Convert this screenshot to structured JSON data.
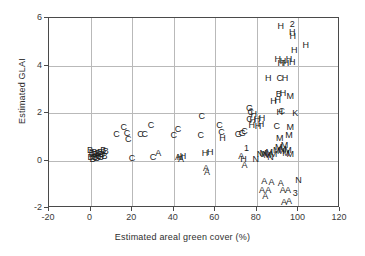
{
  "figure": {
    "background_color": "#ffffff",
    "frame_color": "#4a4a4a",
    "grid_color": "#b9b9b9",
    "marker_color": "#1c1c1c"
  },
  "chart_data": {
    "type": "scatter",
    "title": "",
    "xlabel": "Estimated areal green cover (%)",
    "ylabel": "Estimated GLAI",
    "xlim": [
      -20,
      120
    ],
    "ylim": [
      -2,
      6
    ],
    "xticks": [
      -20,
      0,
      20,
      40,
      60,
      80,
      100,
      120
    ],
    "yticks": [
      -2,
      0,
      2,
      4,
      6
    ],
    "xticklabels": [
      "-20",
      "0",
      "20",
      "40",
      "60",
      "80",
      "100",
      "120"
    ],
    "yticklabels": [
      "-2",
      "0",
      "2",
      "4",
      "6"
    ],
    "grid": true,
    "grid_axis": "both",
    "legend": "none",
    "marker_style": "text-letter",
    "marker_labels": [
      "A",
      "B",
      "C",
      "G",
      "H",
      "K",
      "M",
      "N",
      "1",
      "2",
      "3"
    ],
    "points": [
      {
        "label": "B",
        "x": 0.2,
        "y": 0.42
      },
      {
        "label": "B",
        "x": 0.4,
        "y": 0.12
      },
      {
        "label": "B",
        "x": 1.0,
        "y": 0.26
      },
      {
        "label": "B",
        "x": 1.4,
        "y": 0.02
      },
      {
        "label": "B",
        "x": 2.2,
        "y": 0.3
      },
      {
        "label": "B",
        "x": 2.6,
        "y": 0.1
      },
      {
        "label": "B",
        "x": 3.0,
        "y": 0.22
      },
      {
        "label": "B",
        "x": 3.5,
        "y": 0.05
      },
      {
        "label": "B",
        "x": 4.0,
        "y": 0.28
      },
      {
        "label": "B",
        "x": 4.4,
        "y": 0.14
      },
      {
        "label": "B",
        "x": 5.0,
        "y": 0.33
      },
      {
        "label": "B",
        "x": 5.4,
        "y": 0.09
      },
      {
        "label": "B",
        "x": 6.0,
        "y": 0.24
      },
      {
        "label": "B",
        "x": 6.6,
        "y": 0.4
      },
      {
        "label": "B",
        "x": 7.2,
        "y": 0.16
      },
      {
        "label": "B",
        "x": 7.8,
        "y": 0.35
      },
      {
        "label": "C",
        "x": 13.0,
        "y": 1.06
      },
      {
        "label": "C",
        "x": 16.5,
        "y": 1.38
      },
      {
        "label": "C",
        "x": 18.0,
        "y": 1.12
      },
      {
        "label": "C",
        "x": 18.6,
        "y": 0.86
      },
      {
        "label": "C",
        "x": 20.4,
        "y": 0.06
      },
      {
        "label": "C",
        "x": 24.5,
        "y": 1.06
      },
      {
        "label": "C",
        "x": 26.5,
        "y": 1.06
      },
      {
        "label": "C",
        "x": 29.5,
        "y": 1.46
      },
      {
        "label": "C",
        "x": 30.5,
        "y": 0.12
      },
      {
        "label": "A",
        "x": 33.0,
        "y": 0.26
      },
      {
        "label": "A",
        "x": 42.5,
        "y": 0.1
      },
      {
        "label": "H",
        "x": 43.5,
        "y": 0.12
      },
      {
        "label": "A",
        "x": 44.0,
        "y": 0.04
      },
      {
        "label": "H",
        "x": 45.0,
        "y": 0.14
      },
      {
        "label": "C",
        "x": 40.5,
        "y": 1.04
      },
      {
        "label": "C",
        "x": 42.5,
        "y": 1.3
      },
      {
        "label": "C",
        "x": 54.0,
        "y": 1.82
      },
      {
        "label": "C",
        "x": 53.5,
        "y": 1.02
      },
      {
        "label": "H",
        "x": 55.5,
        "y": 0.28
      },
      {
        "label": "H",
        "x": 58.0,
        "y": 0.3
      },
      {
        "label": "A",
        "x": 56.0,
        "y": -0.34
      },
      {
        "label": "A",
        "x": 56.5,
        "y": -0.54
      },
      {
        "label": "C",
        "x": 62.5,
        "y": 1.44
      },
      {
        "label": "C",
        "x": 63.5,
        "y": 1.14
      },
      {
        "label": "H",
        "x": 64.0,
        "y": 0.92
      },
      {
        "label": "G",
        "x": 71.5,
        "y": 1.06
      },
      {
        "label": "G",
        "x": 73.5,
        "y": 1.12
      },
      {
        "label": "C",
        "x": 74.5,
        "y": 1.2
      },
      {
        "label": "1",
        "x": 75.5,
        "y": 0.48
      },
      {
        "label": "H",
        "x": 74.0,
        "y": 0.02
      },
      {
        "label": "A",
        "x": 74.5,
        "y": -0.22
      },
      {
        "label": "A",
        "x": 73.0,
        "y": 0.14
      },
      {
        "label": "G",
        "x": 77.0,
        "y": 2.16
      },
      {
        "label": "C",
        "x": 77.5,
        "y": 1.98
      },
      {
        "label": "C",
        "x": 77.0,
        "y": 1.72
      },
      {
        "label": "H",
        "x": 78.5,
        "y": 1.68
      },
      {
        "label": "H",
        "x": 78.0,
        "y": 1.44
      },
      {
        "label": "H",
        "x": 79.0,
        "y": 1.92
      },
      {
        "label": "H",
        "x": 80.5,
        "y": 1.72
      },
      {
        "label": "H",
        "x": 81.0,
        "y": 1.42
      },
      {
        "label": "H",
        "x": 82.5,
        "y": 1.48
      },
      {
        "label": "H",
        "x": 83.0,
        "y": 1.76
      },
      {
        "label": "N",
        "x": 80.0,
        "y": 0.04
      },
      {
        "label": "N",
        "x": 82.0,
        "y": 0.22
      },
      {
        "label": "M",
        "x": 83.5,
        "y": 0.26
      },
      {
        "label": "N",
        "x": 84.5,
        "y": 0.22
      },
      {
        "label": "M",
        "x": 85.5,
        "y": 0.18
      },
      {
        "label": "M",
        "x": 86.5,
        "y": 0.3
      },
      {
        "label": "N",
        "x": 87.0,
        "y": 0.1
      },
      {
        "label": "M",
        "x": 88.5,
        "y": 0.24
      },
      {
        "label": "M",
        "x": 90.0,
        "y": 0.38
      },
      {
        "label": "M",
        "x": 91.0,
        "y": 0.52
      },
      {
        "label": "M",
        "x": 92.0,
        "y": 0.34
      },
      {
        "label": "M",
        "x": 93.0,
        "y": 0.46
      },
      {
        "label": "M",
        "x": 93.8,
        "y": 0.6
      },
      {
        "label": "M",
        "x": 94.5,
        "y": 0.28
      },
      {
        "label": "M",
        "x": 95.5,
        "y": 0.42
      },
      {
        "label": "M",
        "x": 96.5,
        "y": 0.22
      },
      {
        "label": "M",
        "x": 91.5,
        "y": 0.92
      },
      {
        "label": "M",
        "x": 96.0,
        "y": 1.04
      },
      {
        "label": "C",
        "x": 90.0,
        "y": 1.4
      },
      {
        "label": "M",
        "x": 96.5,
        "y": 1.36
      },
      {
        "label": "H",
        "x": 91.5,
        "y": 2.02
      },
      {
        "label": "C",
        "x": 92.5,
        "y": 2.06
      },
      {
        "label": "K",
        "x": 99.0,
        "y": 1.96
      },
      {
        "label": "H",
        "x": 88.5,
        "y": 2.46
      },
      {
        "label": "B",
        "x": 91.0,
        "y": 2.76
      },
      {
        "label": "H",
        "x": 93.0,
        "y": 2.82
      },
      {
        "label": "M",
        "x": 96.5,
        "y": 2.66
      },
      {
        "label": "H",
        "x": 90.5,
        "y": 2.52
      },
      {
        "label": "H",
        "x": 86.0,
        "y": 3.44
      },
      {
        "label": "C",
        "x": 91.5,
        "y": 3.44
      },
      {
        "label": "H",
        "x": 94.0,
        "y": 3.44
      },
      {
        "label": "H",
        "x": 90.5,
        "y": 4.24
      },
      {
        "label": "H",
        "x": 92.0,
        "y": 4.06
      },
      {
        "label": "H",
        "x": 94.5,
        "y": 4.08
      },
      {
        "label": "H",
        "x": 96.0,
        "y": 4.22
      },
      {
        "label": "H",
        "x": 97.5,
        "y": 4.1
      },
      {
        "label": "H",
        "x": 93.0,
        "y": 4.16
      },
      {
        "label": "H",
        "x": 98.5,
        "y": 4.62
      },
      {
        "label": "H",
        "x": 104.0,
        "y": 4.82
      },
      {
        "label": "H",
        "x": 92.0,
        "y": 5.62
      },
      {
        "label": "2",
        "x": 97.5,
        "y": 5.72
      },
      {
        "label": "H",
        "x": 97.5,
        "y": 5.36
      },
      {
        "label": "H",
        "x": 97.8,
        "y": 5.18
      },
      {
        "label": "A",
        "x": 84.0,
        "y": -0.92
      },
      {
        "label": "A",
        "x": 87.5,
        "y": -0.96
      },
      {
        "label": "A",
        "x": 83.0,
        "y": -1.28
      },
      {
        "label": "A",
        "x": 86.0,
        "y": -1.3
      },
      {
        "label": "A",
        "x": 84.5,
        "y": -1.52
      },
      {
        "label": "A",
        "x": 92.0,
        "y": -1.0
      },
      {
        "label": "A",
        "x": 93.0,
        "y": -1.3
      },
      {
        "label": "A",
        "x": 95.5,
        "y": -1.28
      },
      {
        "label": "N",
        "x": 100.5,
        "y": -0.86
      },
      {
        "label": "3",
        "x": 99.0,
        "y": -1.42
      },
      {
        "label": "A",
        "x": 93.5,
        "y": -1.78
      },
      {
        "label": "A",
        "x": 96.0,
        "y": -1.76
      }
    ]
  }
}
